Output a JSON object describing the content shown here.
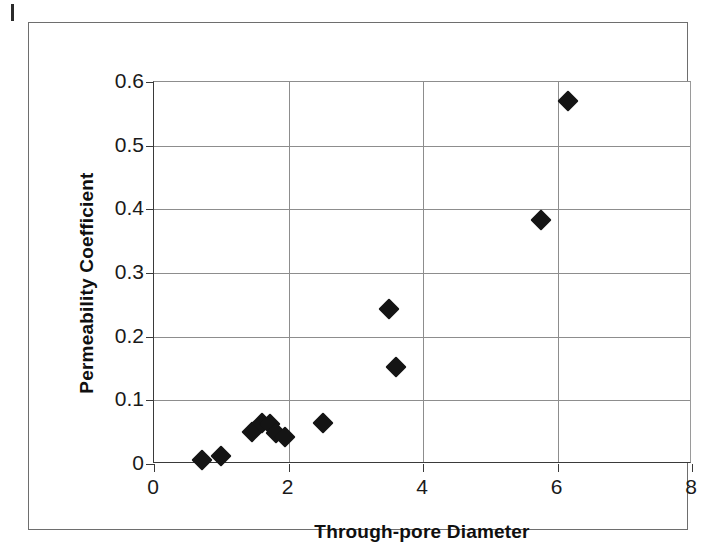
{
  "figure": {
    "background_color": "#ffffff",
    "frame_color": "#6e6e6e",
    "marker_color": "#141414",
    "gridline_color": "#8d8d8d",
    "axis_color": "#3a3a3a"
  },
  "chart_data": {
    "type": "scatter",
    "title": "",
    "xlabel": "Through-pore Diameter",
    "ylabel": "Permeability Coefficient",
    "xlim": [
      0,
      8
    ],
    "ylim": [
      0,
      0.6
    ],
    "xticks": [
      0,
      2,
      4,
      6,
      8
    ],
    "xtick_labels": [
      "0",
      "2",
      "4",
      "6",
      "8"
    ],
    "yticks": [
      0,
      0.1,
      0.2,
      0.3,
      0.4,
      0.5,
      0.6
    ],
    "ytick_labels": [
      "0",
      "0.1",
      "0.2",
      "0.3",
      "0.4",
      "0.5",
      "0.6"
    ],
    "grid": "both",
    "legend": "none",
    "marker": "diamond",
    "series": [
      {
        "name": "Permeability vs through-pore diameter",
        "points": [
          {
            "x": 0.72,
            "y": 0.007
          },
          {
            "x": 1.0,
            "y": 0.013
          },
          {
            "x": 1.45,
            "y": 0.051
          },
          {
            "x": 1.6,
            "y": 0.065
          },
          {
            "x": 1.72,
            "y": 0.063
          },
          {
            "x": 1.82,
            "y": 0.048
          },
          {
            "x": 1.95,
            "y": 0.042
          },
          {
            "x": 2.52,
            "y": 0.064
          },
          {
            "x": 3.5,
            "y": 0.244
          },
          {
            "x": 3.6,
            "y": 0.152
          },
          {
            "x": 5.75,
            "y": 0.383
          },
          {
            "x": 6.15,
            "y": 0.57
          }
        ]
      }
    ]
  }
}
